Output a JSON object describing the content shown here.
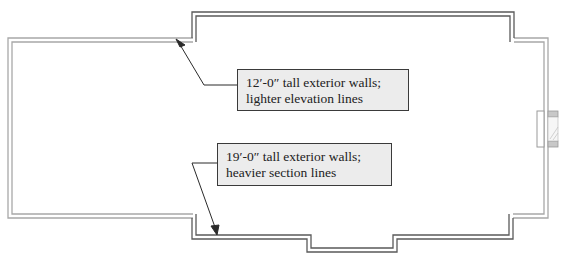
{
  "diagram": {
    "type": "floor-plan-wall-callouts",
    "colors": {
      "light_wall": "#a8a8a8",
      "heavy_wall": "#5a5a5a",
      "callout_fill": "#ececec",
      "callout_border": "#3a3a3a",
      "leader": "#2a2a2a"
    },
    "callouts": [
      {
        "id": "light-walls",
        "line1": "12′-0″ tall exterior walls;",
        "line2": "lighter elevation lines"
      },
      {
        "id": "heavy-walls",
        "line1": "19′-0″ tall exterior walls;",
        "line2": "heavier section lines"
      }
    ],
    "elements": [
      "exterior-walls-light",
      "exterior-walls-heavy",
      "bay-projection",
      "fireplace",
      "leader-arrows"
    ]
  }
}
